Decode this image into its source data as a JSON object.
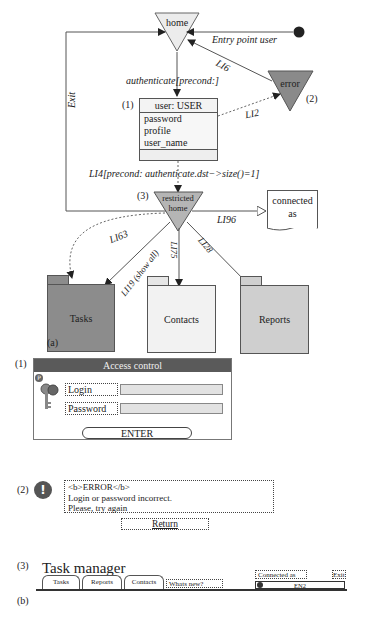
{
  "figure_a": {
    "panel_label": "(a)",
    "nodes": {
      "home": "home",
      "error": "error",
      "error_number": "(2)",
      "restricted_home_line1": "restricted",
      "restricted_home_line2": "home",
      "restricted_number": "(3)",
      "connected_as_line1": "connected",
      "connected_as_line2": "as",
      "entry_point_label": "Entry point user"
    },
    "class_box": {
      "number": "(1)",
      "header": "user: USER",
      "attributes": [
        "password",
        "profile",
        "user_name"
      ]
    },
    "links": {
      "authenticate": "authenticate[precond:]",
      "li6": "LI6",
      "li2": "LI2",
      "exit": "Exit",
      "li4": "LI4[precond: authenticate.dst−>size()=1]",
      "li96": "LI96",
      "li63": "LI63",
      "li119": "LI19 (show all)",
      "li75": "LI75",
      "li28": "LI28"
    },
    "folders": [
      {
        "label": "Tasks",
        "fill": "#8c8c8c",
        "tab_fill": "#8c8c8c"
      },
      {
        "label": "Contacts",
        "fill": "#f2f2f2",
        "tab_fill": "#e6e6e6"
      },
      {
        "label": "Reports",
        "fill": "#cfcfcf",
        "tab_fill": "#cfcfcf"
      }
    ],
    "colors": {
      "home_fill": "#ececec",
      "error_fill": "#8a8a8a",
      "restricted_fill": "#b5b5b5",
      "line": "#555555"
    }
  },
  "figure_b": {
    "panel_label": "(b)",
    "access_control": {
      "number": "(1)",
      "title": "Access control",
      "login_label": "Login",
      "login_value": "",
      "password_label": "Password",
      "password_value": "",
      "enter_button": "ENTER",
      "info_icon": "P"
    },
    "error_dialog": {
      "number": "(2)",
      "icon": "!",
      "lines": [
        "<b>ERROR</b>",
        "Login or password incorrect.",
        "Please, try again"
      ],
      "return_button": "Return"
    },
    "task_manager": {
      "number": "(3)",
      "title": "Task manager",
      "tabs": [
        "Tasks",
        "Reports",
        "Contacts"
      ],
      "whats_new": "Whats new?",
      "connected_as_label": "Connected as",
      "exit_label": "Exit",
      "user_value": "EN2"
    }
  }
}
